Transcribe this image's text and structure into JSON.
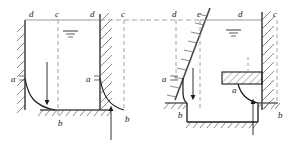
{
  "figure": {
    "type": "engineering-line-diagram",
    "background_color": "#ffffff",
    "line_color": "#1a1a1a",
    "hatch_color": "#4a4a4a",
    "dashed_color": "#808080",
    "ground_color": "#9a9a9a"
  },
  "panels": [
    {
      "id": "left-panel",
      "name": "vertical-wall-case",
      "labels": {
        "top_left_d": "d",
        "top_mid_c": "c",
        "top_right_d": "d",
        "top_far_c": "c",
        "left_a": "a",
        "right_a": "a",
        "bottom_left_b": "b",
        "bottom_right_b": "b"
      },
      "water_symbol": "water-level-marker",
      "arrows": [
        {
          "name": "downward-arrow",
          "direction": "down"
        },
        {
          "name": "upward-arrow",
          "direction": "up"
        }
      ]
    },
    {
      "id": "right-panel",
      "name": "inclined-wall-case",
      "labels": {
        "top_far_left_d": "d",
        "top_left_c": "c",
        "top_mid_d": "d",
        "top_right_c": "c",
        "left_a": "a",
        "mid_a": "a",
        "bottom_left_b": "b",
        "bottom_right_b": "b"
      },
      "water_symbol": "water-level-marker",
      "arrows": [
        {
          "name": "downward-arrow",
          "direction": "down"
        },
        {
          "name": "upward-arrow",
          "direction": "up"
        }
      ]
    }
  ],
  "label_values": {
    "a": "a",
    "b": "b",
    "c": "c",
    "d": "d"
  }
}
